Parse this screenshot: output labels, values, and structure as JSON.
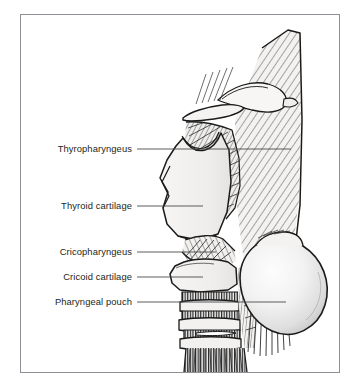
{
  "figure": {
    "kind": "anatomical-illustration",
    "view": "lateral",
    "frame": {
      "border_color": "#8e9095",
      "background": "#ffffff"
    },
    "palette": {
      "ink": "#231f20",
      "outline": "#1a1a1a",
      "cartilage_fill": "#f0efee",
      "muscle_fill": "#efeeed",
      "pouch_fill_center": "#fbfbfb",
      "pouch_fill_edge": "#c9c9c9",
      "leader_line": "#4a4a4a",
      "hatch": "#2b2b2b"
    },
    "labels": [
      {
        "id": "thyropharyngeus",
        "text": "Thyropharyngeus",
        "text_right_x": 132,
        "baseline_y": 153,
        "leader": {
          "x1": 137,
          "y1": 149,
          "x2": 291,
          "y2": 149
        }
      },
      {
        "id": "thyroid-cartilage",
        "text": "Thyroid cartilage",
        "text_right_x": 132,
        "baseline_y": 210,
        "leader": {
          "x1": 137,
          "y1": 206,
          "x2": 203,
          "y2": 206
        }
      },
      {
        "id": "cricopharyngeus",
        "text": "Cricopharyngeus",
        "text_right_x": 132,
        "baseline_y": 256,
        "leader": {
          "x1": 137,
          "y1": 252,
          "x2": 216,
          "y2": 252
        }
      },
      {
        "id": "cricoid-cartilage",
        "text": "Cricoid cartilage",
        "text_right_x": 132,
        "baseline_y": 281,
        "leader": {
          "x1": 137,
          "y1": 277,
          "x2": 203,
          "y2": 277
        }
      },
      {
        "id": "pharyngeal-pouch",
        "text": "Pharyngeal pouch",
        "text_right_x": 132,
        "baseline_y": 306,
        "leader": {
          "x1": 137,
          "y1": 302,
          "x2": 286,
          "y2": 302
        }
      }
    ]
  }
}
